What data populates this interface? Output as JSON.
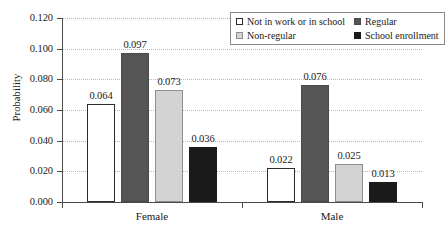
{
  "chart_data": {
    "type": "bar",
    "title": "",
    "xlabel": "",
    "ylabel": "Probability",
    "ylim": [
      0.0,
      0.12
    ],
    "ytick_labels": [
      "0.000",
      "0.020",
      "0.040",
      "0.060",
      "0.080",
      "0.100",
      "0.120"
    ],
    "ytick_values": [
      0.0,
      0.02,
      0.04,
      0.06,
      0.08,
      0.1,
      0.12
    ],
    "grid": true,
    "legend_position": "top-right",
    "categories": [
      "Female",
      "Male"
    ],
    "series": [
      {
        "name": "Not in work or in school",
        "color": "#ffffff",
        "values": [
          0.064,
          0.022
        ],
        "labels": [
          "0.064",
          "0.022"
        ]
      },
      {
        "name": "Regular",
        "color": "#555555",
        "values": [
          0.097,
          0.076
        ],
        "labels": [
          "0.097",
          "0.076"
        ]
      },
      {
        "name": "Non-regular",
        "color": "#d3d3d3",
        "values": [
          0.073,
          0.025
        ],
        "labels": [
          "0.073",
          "0.025"
        ]
      },
      {
        "name": "School enrollment",
        "color": "#1a1a1a",
        "values": [
          0.036,
          0.013
        ],
        "labels": [
          "0.036",
          "0.013"
        ]
      }
    ]
  },
  "legend": {
    "entries": [
      {
        "label": "Not in work or in school",
        "swatch": "s0"
      },
      {
        "label": "Regular",
        "swatch": "s1"
      },
      {
        "label": "Non-regular",
        "swatch": "s2"
      },
      {
        "label": "School enrollment",
        "swatch": "s3"
      }
    ]
  },
  "colors": {
    "axis": "#4a4a4a",
    "grid": "#b9b9b9",
    "text": "#1a1a1a",
    "legend_border": "#8a8a8a"
  }
}
